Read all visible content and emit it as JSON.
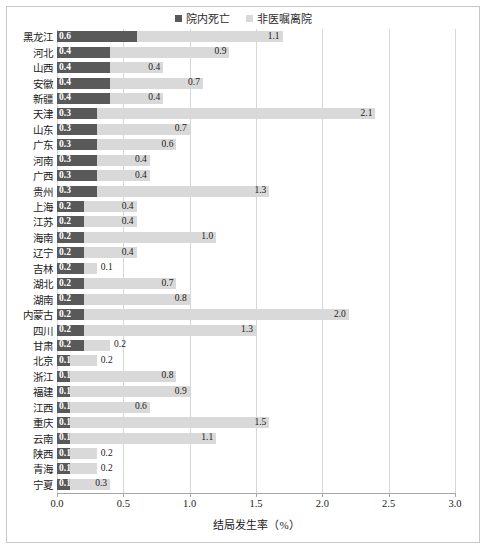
{
  "chart_data": {
    "type": "bar",
    "orientation": "horizontal",
    "stacked": true,
    "title": "",
    "xlabel": "结局发生率（%）",
    "ylabel": "",
    "xlim": [
      0.0,
      3.0
    ],
    "xticks": [
      "0.0",
      "0.5",
      "1.0",
      "1.5",
      "2.0",
      "2.5",
      "3.0"
    ],
    "xtick_values": [
      0.0,
      0.5,
      1.0,
      1.5,
      2.0,
      2.5,
      3.0
    ],
    "grid": "vertical",
    "legend_position": "top-center",
    "legend": [
      "院内死亡",
      "非医嘱离院"
    ],
    "colors": {
      "院内死亡": "#595959",
      "非医嘱离院": "#d9d9d9"
    },
    "categories": [
      "黑龙江",
      "河北",
      "山西",
      "安徽",
      "新疆",
      "天津",
      "山东",
      "广东",
      "河南",
      "广西",
      "贵州",
      "上海",
      "江苏",
      "海南",
      "辽宁",
      "吉林",
      "湖北",
      "湖南",
      "内蒙古",
      "四川",
      "甘肃",
      "北京",
      "浙江",
      "福建",
      "江西",
      "重庆",
      "云南",
      "陕西",
      "青海",
      "宁夏"
    ],
    "series": [
      {
        "name": "院内死亡",
        "values": [
          0.6,
          0.4,
          0.4,
          0.4,
          0.4,
          0.3,
          0.3,
          0.3,
          0.3,
          0.3,
          0.3,
          0.2,
          0.2,
          0.2,
          0.2,
          0.2,
          0.2,
          0.2,
          0.2,
          0.2,
          0.2,
          0.1,
          0.1,
          0.1,
          0.1,
          0.1,
          0.1,
          0.1,
          0.1,
          0.1
        ],
        "labels": [
          "0.6",
          "0.4",
          "0.4",
          "0.4",
          "0.4",
          "0.3",
          "0.3",
          "0.3",
          "0.3",
          "0.3",
          "0.3",
          "0.2",
          "0.2",
          "0.2",
          "0.2",
          "0.2",
          "0.2",
          "0.2",
          "0.2",
          "0.2",
          "0.2",
          "0.1",
          "0.1",
          "0.1",
          "0.1",
          "0.1",
          "0.1",
          "0.1",
          "0.1",
          "0.1"
        ]
      },
      {
        "name": "非医嘱离院",
        "values": [
          1.1,
          0.9,
          0.4,
          0.7,
          0.4,
          2.1,
          0.7,
          0.6,
          0.4,
          0.4,
          1.3,
          0.4,
          0.4,
          1.0,
          0.4,
          0.1,
          0.7,
          0.8,
          2.0,
          1.3,
          0.2,
          0.2,
          0.8,
          0.9,
          0.6,
          1.5,
          1.1,
          0.2,
          0.2,
          0.3
        ],
        "labels": [
          "1.1",
          "0.9",
          "0.4",
          "0.7",
          "0.4",
          "2.1",
          "0.7",
          "0.6",
          "0.4",
          "0.4",
          "1.3",
          "0.4",
          "0.4",
          "1.0",
          "0.4",
          "0.1",
          "0.7",
          "0.8",
          "2.0",
          "1.3",
          "0.2",
          "0.2",
          "0.8",
          "0.9",
          "0.6",
          "1.5",
          "1.1",
          "0.2",
          "0.2",
          "0.3"
        ]
      }
    ]
  }
}
